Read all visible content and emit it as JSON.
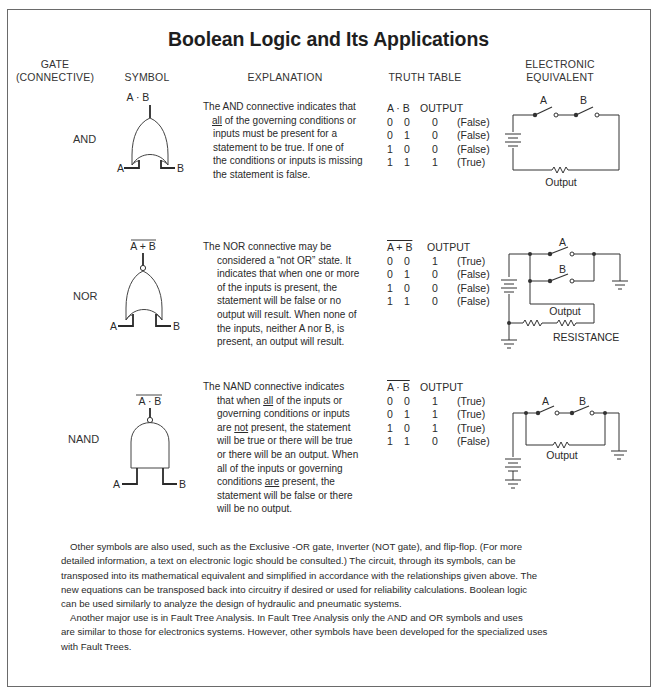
{
  "title": "Boolean Logic and Its Applications",
  "headers": {
    "gate_line1": "GATE",
    "gate_line2": "(CONNECTIVE)",
    "symbol": "SYMBOL",
    "explanation": "EXPLANATION",
    "truth_table": "TRUTH TABLE",
    "electronic_line1": "ELECTRONIC",
    "electronic_line2": "EQUIVALENT"
  },
  "gates": [
    {
      "name": "AND",
      "symbol_output": "A · B",
      "input_a": "A",
      "input_b": "B",
      "explanation_lines": [
        "The AND connective indicates that",
        "all",
        " of the governing conditions or",
        "inputs must be present for a",
        "statement to be true.  If one of",
        "the conditions or inputs is missing",
        "the statement is false."
      ],
      "truth_table": {
        "header_expr": "A · B",
        "header_output": "OUTPUT",
        "rows": [
          {
            "a": "0",
            "b": "0",
            "out": "0",
            "label": "(False)"
          },
          {
            "a": "0",
            "b": "1",
            "out": "0",
            "label": "(False)"
          },
          {
            "a": "1",
            "b": "0",
            "out": "0",
            "label": "(False)"
          },
          {
            "a": "1",
            "b": "1",
            "out": "1",
            "label": "(True)"
          }
        ]
      },
      "circuit": {
        "switch_a": "A",
        "switch_b": "B",
        "output_label": "Output"
      }
    },
    {
      "name": "NOR",
      "symbol_output": "A + B",
      "input_a": "A",
      "input_b": "B",
      "explanation_lines": [
        "The NOR connective may be",
        "considered a “not OR” state.  It",
        "indicates that when one or more",
        "of the inputs is present, the",
        "statement will be false or no",
        "output will result.  When none of",
        "the inputs, neither A nor B, is",
        "present, an output will result."
      ],
      "truth_table": {
        "header_expr": "A + B",
        "header_output": "OUTPUT",
        "rows": [
          {
            "a": "0",
            "b": "0",
            "out": "1",
            "label": "(True)"
          },
          {
            "a": "0",
            "b": "1",
            "out": "0",
            "label": "(False)"
          },
          {
            "a": "1",
            "b": "0",
            "out": "0",
            "label": "(False)"
          },
          {
            "a": "1",
            "b": "1",
            "out": "0",
            "label": "(False)"
          }
        ]
      },
      "circuit": {
        "switch_a": "A",
        "switch_b": "B",
        "output_label": "Output",
        "resistance_label": "RESISTANCE"
      }
    },
    {
      "name": "NAND",
      "symbol_output": "A · B",
      "input_a": "A",
      "input_b": "B",
      "explanation_lines": [
        "The NAND connective indicates",
        "that when ",
        "all",
        " of the inputs or",
        "governing conditions or inputs",
        "are ",
        "not",
        " present, the statement",
        "will be true or there will be true",
        "or there will be an output.  When",
        "all of the inputs or governing",
        "conditions ",
        "are",
        "  present, the",
        "statement will be false or there",
        "will be no output."
      ],
      "truth_table": {
        "header_expr": "A · B",
        "header_output": "OUTPUT",
        "rows": [
          {
            "a": "0",
            "b": "0",
            "out": "1",
            "label": "(True)"
          },
          {
            "a": "0",
            "b": "1",
            "out": "1",
            "label": "(True)"
          },
          {
            "a": "1",
            "b": "0",
            "out": "1",
            "label": "(True)"
          },
          {
            "a": "1",
            "b": "1",
            "out": "0",
            "label": "(False)"
          }
        ]
      },
      "circuit": {
        "switch_a": "A",
        "switch_b": "B",
        "output_label": "Output"
      }
    }
  ],
  "paragraphs": [
    [
      "Other symbols are also used, such as the Exclusive -OR gate, Inverter (NOT gate), and flip-flop.  (For more",
      "detailed information, a text on electronic logic should be consulted.)  The circuit, through its symbols, can be",
      "transposed into its mathematical equivalent and simplified in accordance with the relationships given above.  The",
      "new equations can be transposed back into circuitry if desired or used for reliability calculations.  Boolean logic",
      "can be used similarly to analyze the design of hydraulic and pneumatic systems."
    ],
    [
      "Another major use is in Fault Tree Analysis.  In Fault Tree Analysis only the AND and OR symbols and uses",
      "are similar to those for electronics systems.  However, other symbols have been developed for the specialized uses",
      "with Fault Trees."
    ]
  ]
}
